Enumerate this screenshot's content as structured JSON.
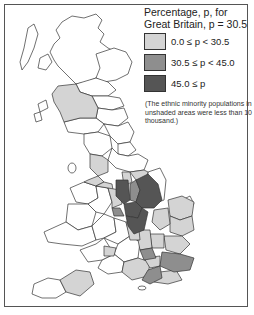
{
  "legend": {
    "title_line1": "Percentage, p, for",
    "title_line2": "Great Britain, p = 30.5",
    "items": [
      {
        "label": "0.0 ≤ p < 30.5",
        "color": "#d4d4d4"
      },
      {
        "label": "30.5 ≤ p < 45.0",
        "color": "#8e8e8e"
      },
      {
        "label": "45.0 ≤ p",
        "color": "#555555"
      }
    ]
  },
  "note": "(The ethnic minority populations in unshaded areas were less than 10 thousand.)",
  "colors": {
    "low": "#d4d4d4",
    "mid": "#8e8e8e",
    "high": "#555555",
    "unshaded": "#ffffff",
    "outline": "#333333"
  }
}
